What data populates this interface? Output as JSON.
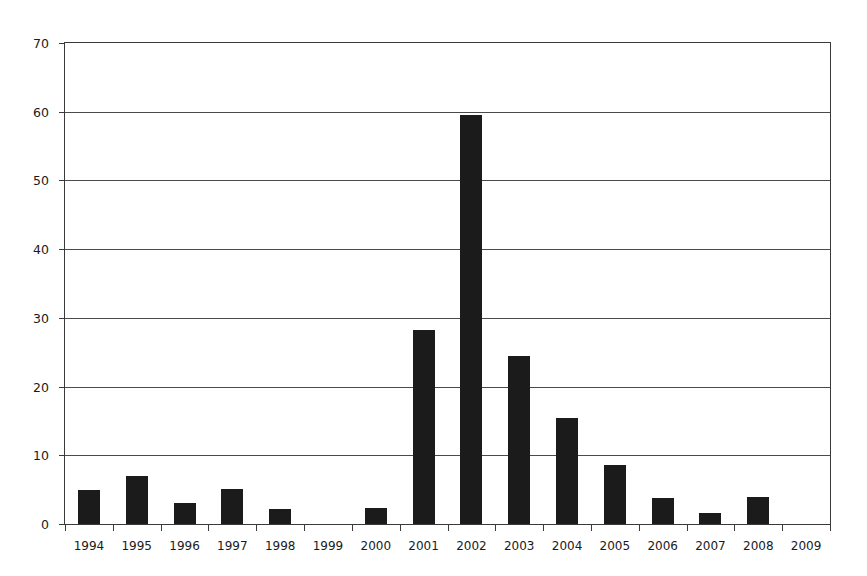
{
  "chart_data": {
    "type": "bar",
    "title": "",
    "subtitle": "",
    "xlabel": "",
    "ylabel": "",
    "categories": [
      "1994",
      "1995",
      "1996",
      "1997",
      "1998",
      "1999",
      "2000",
      "2001",
      "2002",
      "2003",
      "2004",
      "2005",
      "2006",
      "2007",
      "2008",
      "2009"
    ],
    "values": [
      4.9,
      7.0,
      3.0,
      5.1,
      2.2,
      0,
      2.3,
      28.3,
      59.5,
      24.4,
      15.4,
      8.6,
      3.8,
      1.6,
      4.0,
      0
    ],
    "series": [
      {
        "name": "",
        "values": [
          4.9,
          7.0,
          3.0,
          5.1,
          2.2,
          0,
          2.3,
          28.3,
          59.5,
          24.4,
          15.4,
          8.6,
          3.8,
          1.6,
          4.0,
          0
        ]
      }
    ],
    "ylim": [
      0,
      70
    ],
    "yticks": [
      0,
      10,
      20,
      30,
      40,
      50,
      60,
      70
    ],
    "ytick_labels": [
      "0",
      "10",
      "20",
      "30",
      "40",
      "50",
      "60",
      "70"
    ],
    "grid": true,
    "grid_axis": "y",
    "legend": false,
    "legend_position": "none",
    "bar_color": "#1b1b1b",
    "axis_color": "#3a3a3a",
    "grid_color": "#4a4a4a",
    "background_color": "#ffffff",
    "annotations": []
  }
}
